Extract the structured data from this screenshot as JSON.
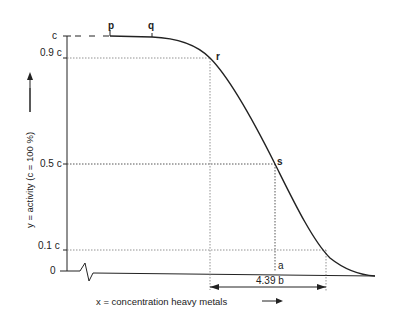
{
  "diagram": {
    "title": "",
    "y_axis": {
      "label": "y = activity  (c = 100 %)",
      "ticks": [
        "c",
        "0.9 c",
        "0.5 c",
        "0.1 c",
        "0"
      ]
    },
    "x_axis": {
      "label": "x = concentration  heavy  metals"
    },
    "points": {
      "p": "p",
      "q": "q",
      "r": "r",
      "s": "s",
      "a": "a"
    },
    "interval_label": "4.39 b",
    "colors": {
      "line": "#222222",
      "guide": "#555555",
      "background": "#ffffff"
    }
  }
}
